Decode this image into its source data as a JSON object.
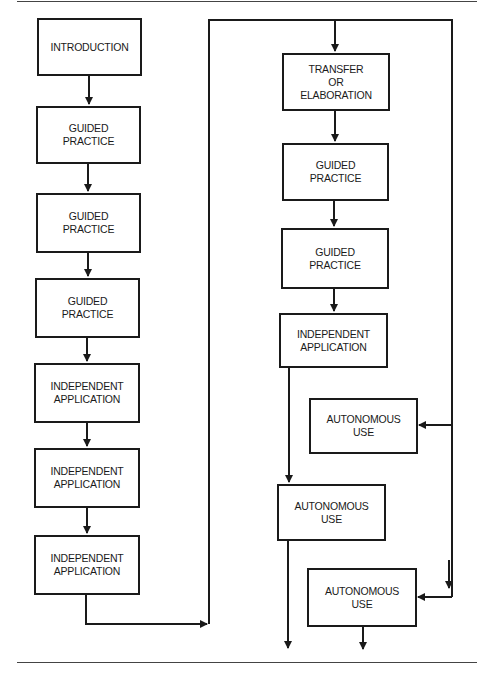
{
  "colors": {
    "line": "#1a1a1a",
    "background": "#ffffff",
    "rule": "#444444"
  },
  "left_column": {
    "steps": [
      {
        "label": "INTRODUCTION"
      },
      {
        "label": "GUIDED\nPRACTICE"
      },
      {
        "label": "GUIDED\nPRACTICE"
      },
      {
        "label": "GUIDED\nPRACTICE"
      },
      {
        "label": "INDEPENDENT\nAPPLICATION"
      },
      {
        "label": "INDEPENDENT\nAPPLICATION"
      },
      {
        "label": "INDEPENDENT\nAPPLICATION"
      }
    ]
  },
  "right_column": {
    "steps": [
      {
        "label": "TRANSFER\nOR\nELABORATION"
      },
      {
        "label": "GUIDED\nPRACTICE"
      },
      {
        "label": "GUIDED\nPRACTICE"
      },
      {
        "label": "INDEPENDENT\nAPPLICATION"
      },
      {
        "label": "AUTONOMOUS\nUSE"
      },
      {
        "label": "AUTONOMOUS\nUSE"
      },
      {
        "label": "AUTONOMOUS\nUSE"
      }
    ]
  }
}
